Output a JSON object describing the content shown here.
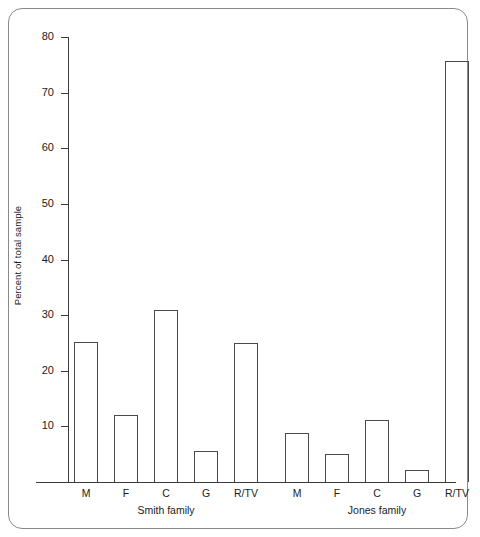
{
  "chart_data": {
    "type": "bar",
    "title": "",
    "xlabel": "",
    "ylabel": "Percent of total sample",
    "ylim": [
      0,
      80
    ],
    "yticks": [
      0,
      10,
      20,
      30,
      40,
      50,
      60,
      70,
      80
    ],
    "ytick_labels": [
      "",
      "10",
      "20",
      "30",
      "40",
      "50",
      "60",
      "70",
      "80"
    ],
    "grid": false,
    "legend": "none",
    "categories": [
      "M",
      "F",
      "C",
      "G",
      "R/TV"
    ],
    "groups": [
      {
        "name": "Smith family",
        "label": "Smith family",
        "values": [
          25.2,
          12.0,
          31.0,
          5.5,
          25.0
        ]
      },
      {
        "name": "Jones family",
        "label": "Jones family",
        "values": [
          8.8,
          5.0,
          11.2,
          2.2,
          75.6
        ]
      }
    ],
    "bar_style": {
      "fill": "none",
      "edge_color": "#4a4a4a",
      "edge_width": 1.4
    },
    "frame_color": "#8a8a8a",
    "axis_color": "#3b3b3b",
    "background": "#ffffff"
  }
}
